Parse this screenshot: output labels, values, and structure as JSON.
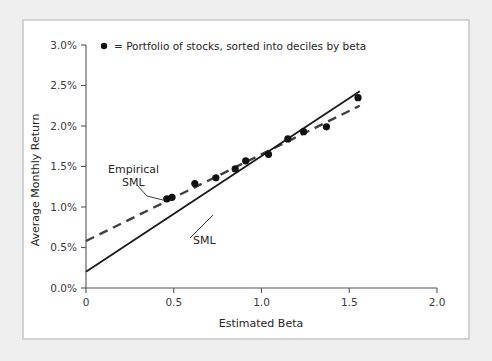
{
  "figure": {
    "panel_bg": "#ffffff",
    "outer_bg": "#efefef",
    "border_color": "#d2d2d2"
  },
  "legend": {
    "marker_name": "filled-circle-marker",
    "text": "= Portfolio of stocks, sorted into deciles by beta"
  },
  "annotations": {
    "empirical_line1": "Empirical",
    "empirical_line2": "SML",
    "sml": "SML"
  },
  "chart_data": {
    "type": "scatter",
    "title": "",
    "xlabel": "Estimated Beta",
    "ylabel": "Average Monthly Return",
    "xlim": [
      0,
      2.0
    ],
    "ylim": [
      0,
      3.0
    ],
    "xticks": [
      0,
      0.5,
      1.0,
      1.5,
      2.0
    ],
    "xtick_labels": [
      "0",
      "0.5",
      "1.0",
      "1.5",
      "2.0"
    ],
    "yticks": [
      0,
      0.5,
      1.0,
      1.5,
      2.0,
      2.5,
      3.0
    ],
    "ytick_labels": [
      "0.0%",
      "0.5%",
      "1.0%",
      "1.5%",
      "2.0%",
      "2.5%",
      "3.0%"
    ],
    "grid": false,
    "legend_position": "top-left-inside",
    "points": [
      {
        "x": 0.46,
        "y": 1.1
      },
      {
        "x": 0.49,
        "y": 1.12
      },
      {
        "x": 0.62,
        "y": 1.29
      },
      {
        "x": 0.74,
        "y": 1.36
      },
      {
        "x": 0.85,
        "y": 1.47
      },
      {
        "x": 0.91,
        "y": 1.57
      },
      {
        "x": 1.04,
        "y": 1.65
      },
      {
        "x": 1.15,
        "y": 1.84
      },
      {
        "x": 1.24,
        "y": 1.93
      },
      {
        "x": 1.37,
        "y": 1.99
      },
      {
        "x": 1.55,
        "y": 2.35
      }
    ],
    "series": [
      {
        "name": "SML",
        "style": "solid",
        "color": "#1a1a1a",
        "x": [
          0,
          1.56
        ],
        "y": [
          0.2,
          2.43
        ]
      },
      {
        "name": "Empirical SML",
        "style": "dashed",
        "color": "#404040",
        "x": [
          0,
          1.56
        ],
        "y": [
          0.58,
          2.25
        ]
      }
    ]
  }
}
